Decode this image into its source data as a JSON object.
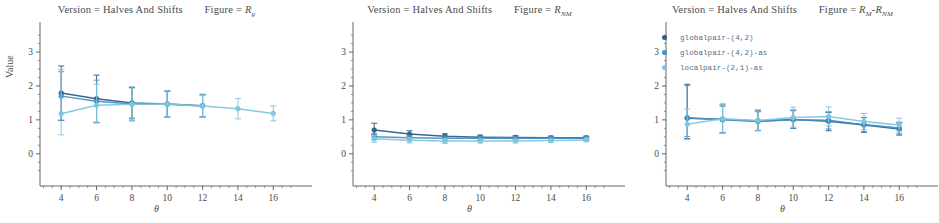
{
  "chart_data": {
    "type": "line",
    "xlabel": "θ",
    "ylabel": "Value",
    "x": [
      4,
      6,
      8,
      10,
      12,
      14,
      16
    ],
    "xlim": [
      2.8,
      17.4
    ],
    "ylim": [
      -0.95,
      3.65
    ],
    "xticks": [
      4,
      6,
      8,
      10,
      12,
      14,
      16
    ],
    "yticks": [
      0,
      1,
      2,
      3
    ],
    "grid": false,
    "legend_position": "top-left of third panel",
    "series_names": [
      "globalpair-(4,2)",
      "globalpair-(4,2)-as",
      "localpair-(2,1)-as"
    ],
    "series_colors": [
      "#2e5f8a",
      "#4a90c4",
      "#7fc6df"
    ],
    "panels": [
      {
        "facet_version": "Version = Halves And Shifts",
        "facet_figure_prefix": "Figure = ",
        "facet_figure_symbol": "R",
        "facet_figure_sub": "g",
        "series": [
          {
            "name": "globalpair-(4,2)",
            "color": "#2e5f8a",
            "values": [
              1.79,
              1.62,
              1.5,
              1.47,
              1.42,
              null,
              null
            ],
            "err_low": [
              0.8,
              0.7,
              0.45,
              0.38,
              0.33,
              null,
              null
            ],
            "err_high": [
              0.8,
              0.7,
              0.45,
              0.38,
              0.33,
              null,
              null
            ]
          },
          {
            "name": "globalpair-(4,2)-as",
            "color": "#4a90c4",
            "values": [
              1.7,
              1.55,
              1.47,
              1.46,
              1.41,
              null,
              null
            ],
            "err_low": [
              0.72,
              0.62,
              0.48,
              0.38,
              0.32,
              null,
              null
            ],
            "err_high": [
              0.72,
              0.62,
              0.48,
              0.38,
              0.32,
              null,
              null
            ]
          },
          {
            "name": "localpair-(2,1)-as",
            "color": "#7fc6df",
            "values": [
              1.18,
              1.43,
              1.46,
              1.47,
              1.41,
              1.33,
              1.19
            ],
            "err_low": [
              0.62,
              0.52,
              0.5,
              0.38,
              0.33,
              0.3,
              0.22
            ],
            "err_high": [
              1.3,
              0.62,
              0.52,
              0.4,
              0.35,
              0.3,
              0.22
            ]
          }
        ]
      },
      {
        "facet_version": "Version = Halves And Shifts",
        "facet_figure_prefix": "Figure = ",
        "facet_figure_symbol": "R",
        "facet_figure_sub": "NM",
        "series": [
          {
            "name": "globalpair-(4,2)",
            "color": "#2e5f8a",
            "values": [
              0.7,
              0.58,
              0.52,
              0.49,
              0.48,
              0.47,
              0.47
            ],
            "err_low": [
              0.12,
              0.08,
              0.06,
              0.05,
              0.05,
              0.04,
              0.04
            ],
            "err_high": [
              0.2,
              0.1,
              0.07,
              0.06,
              0.05,
              0.05,
              0.05
            ]
          },
          {
            "name": "globalpair-(4,2)-as",
            "color": "#4a90c4",
            "values": [
              0.5,
              0.47,
              0.46,
              0.46,
              0.46,
              0.46,
              0.46
            ],
            "err_low": [
              0.08,
              0.07,
              0.06,
              0.05,
              0.05,
              0.05,
              0.05
            ],
            "err_high": [
              0.08,
              0.07,
              0.06,
              0.05,
              0.05,
              0.05,
              0.05
            ]
          },
          {
            "name": "localpair-(2,1)-as",
            "color": "#7fc6df",
            "values": [
              0.44,
              0.4,
              0.38,
              0.38,
              0.38,
              0.39,
              0.41
            ],
            "err_low": [
              0.1,
              0.08,
              0.07,
              0.06,
              0.06,
              0.05,
              0.05
            ],
            "err_high": [
              0.1,
              0.08,
              0.07,
              0.06,
              0.06,
              0.05,
              0.05
            ]
          }
        ]
      },
      {
        "facet_version": "Version = Halves And Shifts",
        "facet_figure_prefix": "Figure = ",
        "facet_figure_symbol": "R",
        "facet_figure_sub": "M",
        "facet_figure_symbol2": "R",
        "facet_figure_sub2": "NM",
        "series": [
          {
            "name": "globalpair-(4,2)",
            "color": "#2e5f8a",
            "values": [
              1.05,
              1.02,
              0.97,
              1.01,
              0.96,
              0.85,
              0.73
            ],
            "err_low": [
              0.6,
              0.4,
              0.28,
              0.26,
              0.28,
              0.22,
              0.18
            ],
            "err_high": [
              1.0,
              0.42,
              0.3,
              0.28,
              0.26,
              0.22,
              0.18
            ]
          },
          {
            "name": "globalpair-(4,2)-as",
            "color": "#4a90c4",
            "values": [
              1.06,
              1.0,
              0.95,
              1.0,
              0.99,
              0.86,
              0.76
            ],
            "err_low": [
              0.55,
              0.38,
              0.27,
              0.25,
              0.26,
              0.21,
              0.17
            ],
            "err_high": [
              0.95,
              0.4,
              0.29,
              0.27,
              0.25,
              0.21,
              0.17
            ]
          },
          {
            "name": "localpair-(2,1)-as",
            "color": "#7fc6df",
            "values": [
              0.87,
              1.03,
              0.98,
              1.07,
              1.1,
              0.95,
              0.85
            ],
            "err_low": [
              0.45,
              0.42,
              0.3,
              0.28,
              0.28,
              0.24,
              0.2
            ],
            "err_high": [
              0.45,
              0.45,
              0.32,
              0.3,
              0.28,
              0.24,
              0.2
            ]
          }
        ]
      }
    ],
    "legend": [
      {
        "label": "globalpair-(4,2)",
        "color": "#2e5f8a"
      },
      {
        "label": "globalpair-(4,2)-as",
        "color": "#4a90c4"
      },
      {
        "label": "localpair-(2,1)-as",
        "color": "#7fc6df"
      }
    ]
  }
}
